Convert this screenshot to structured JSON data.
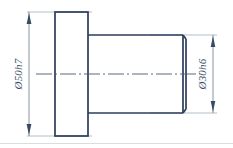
{
  "drawing": {
    "title": "Stepped shaft with flange - technical drawing",
    "background_color": "#fefffe",
    "line_color": "#2b3d5c",
    "thin_line_color": "#8c98ab",
    "center_line_color": "#4a5a75",
    "footer_rule_color": "#d9dde2",
    "dimensions": [
      {
        "id": "flange-diameter",
        "label": "Ø50h7",
        "orientation": "vertical",
        "side": "left",
        "nominal": 50,
        "tolerance_class": "h7",
        "symbol": "Ø"
      },
      {
        "id": "shaft-diameter",
        "label": "Ø30h6",
        "orientation": "vertical",
        "side": "right",
        "nominal": 30,
        "tolerance_class": "h6",
        "symbol": "Ø"
      }
    ],
    "features": [
      {
        "id": "flange-body",
        "name": "flange"
      },
      {
        "id": "shaft-body",
        "name": "shaft"
      },
      {
        "id": "shaft-chamfer",
        "name": "chamfer"
      },
      {
        "id": "axis-centerline",
        "name": "centerline"
      }
    ]
  }
}
